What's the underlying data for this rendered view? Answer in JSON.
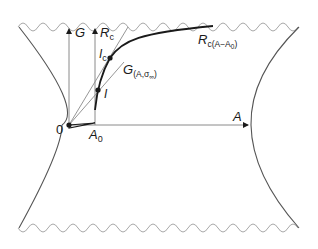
{
  "diagram": {
    "type": "schematic-crack-resistance-plot",
    "axes": {
      "x_label": "A",
      "y_label_1": "G",
      "y_label_2_main": "R",
      "y_label_2_sub": "c",
      "origin_label": "0"
    },
    "labels": {
      "a0_main": "A",
      "a0_sub": "0",
      "ic_main": "I",
      "ic_sub": "c",
      "i_point": "I",
      "g_line_main": "G",
      "g_line_sub": "(A,σ",
      "g_line_sub2": "∞",
      "g_line_close": ")",
      "r_curve_main": "R",
      "r_curve_sub": "c(A−A",
      "r_curve_sub2": "0",
      "r_curve_close": ")"
    },
    "colors": {
      "ink": "#1a1a1a",
      "thin_line": "#8a8a8a",
      "wavy_edge": "#a0a0a0",
      "specimen_edge": "#555555"
    }
  }
}
